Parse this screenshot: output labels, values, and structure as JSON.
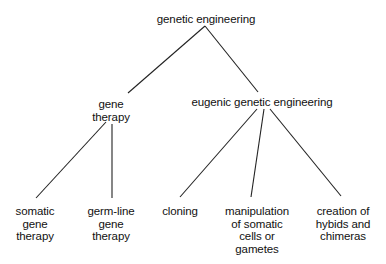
{
  "diagram": {
    "type": "tree",
    "root": {
      "label": "genetic engineering",
      "children": [
        {
          "label": "gene therapy",
          "lines": [
            "gene",
            "therapy"
          ],
          "children": [
            {
              "label": "somatic gene therapy",
              "lines": [
                "somatic",
                "gene",
                "therapy"
              ]
            },
            {
              "label": "germ-line gene therapy",
              "lines": [
                "germ-line",
                "gene",
                "therapy"
              ]
            }
          ]
        },
        {
          "label": "eugenic genetic engineering",
          "children": [
            {
              "label": "cloning",
              "lines": [
                "cloning"
              ]
            },
            {
              "label": "manipulation of somatic cells or gametes",
              "lines": [
                "manipulation",
                "of somatic",
                "cells or",
                "gametes"
              ]
            },
            {
              "label": "creation of hybids and chimeras",
              "lines": [
                "creation of",
                "hybids and",
                "chimeras"
              ]
            }
          ]
        }
      ]
    }
  },
  "nodes": {
    "root": "genetic engineering",
    "gene_therapy": [
      "gene",
      "therapy"
    ],
    "eugenic": "eugenic genetic engineering",
    "somatic": [
      "somatic",
      "gene",
      "therapy"
    ],
    "germline": [
      "germ-line",
      "gene",
      "therapy"
    ],
    "cloning": "cloning",
    "manipulation": [
      "manipulation",
      "of somatic",
      "cells or",
      "gametes"
    ],
    "creation": [
      "creation of",
      "hybids and",
      "chimeras"
    ]
  },
  "colors": {
    "line": "#222222",
    "text": "#111111",
    "background": "#ffffff"
  }
}
